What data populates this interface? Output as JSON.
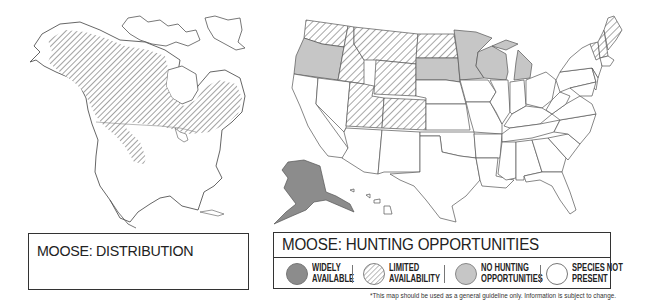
{
  "distribution_panel": {
    "title": "MOOSE: DISTRIBUTION",
    "region": "North America",
    "range_areas": [
      "Alaska",
      "Canada (boreal)",
      "Northern Rockies (US)",
      "Great Lakes region",
      "New England"
    ]
  },
  "hunting_panel": {
    "title": "MOOSE: HUNTING OPPORTUNITIES",
    "legend": [
      {
        "key": "widely",
        "label_line1": "WIDELY",
        "label_line2": "AVAILABLE",
        "style": "solid-dark",
        "color": "#8c8c8c"
      },
      {
        "key": "limited",
        "label_line1": "LIMITED",
        "label_line2": "AVAILABILITY",
        "style": "hatched",
        "color": "#9a9a9a"
      },
      {
        "key": "none",
        "label_line1": "NO HUNTING",
        "label_line2": "OPPORTUNITIES",
        "style": "solid-light",
        "color": "#c6c6c6"
      },
      {
        "key": "absent",
        "label_line1": "SPECIES NOT",
        "label_line2": "PRESENT",
        "style": "empty",
        "color": "#ffffff"
      }
    ],
    "states": {
      "widely_available": [
        "Alaska"
      ],
      "limited_availability": [
        "Washington",
        "Idaho",
        "Montana",
        "Wyoming",
        "Utah",
        "Colorado",
        "North Dakota",
        "Vermont",
        "New Hampshire",
        "Maine"
      ],
      "no_hunting_opportunities": [
        "Oregon",
        "South Dakota",
        "Minnesota",
        "Wisconsin",
        "Michigan"
      ],
      "species_not_present": [
        "all other states"
      ]
    }
  },
  "footnote": "*This map should be used as a general guideline only. Information is subject to change.",
  "colors": {
    "outline": "#555555",
    "widely": "#8c8c8c",
    "none": "#c6c6c6",
    "hatch": "#8a8a8a",
    "border": "#333333"
  }
}
